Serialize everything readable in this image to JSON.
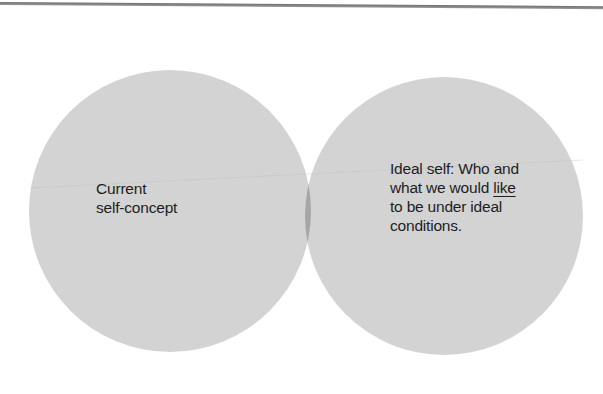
{
  "diagram": {
    "type": "venn",
    "colors": {
      "circle_fill": "#d3d3d3",
      "overlap_fill": "#a6a6a6",
      "text": "#1e1e1e",
      "rule": "#7a7a7a",
      "background": "#ffffff"
    },
    "sets": [
      {
        "id": "current-self-concept",
        "lines": [
          "Current",
          "self-concept"
        ]
      },
      {
        "id": "ideal-self",
        "lines": [
          "Ideal self: Who and",
          "what we would ",
          "like",
          "to be under ideal",
          "conditions."
        ]
      }
    ],
    "overlap": {
      "label": ""
    }
  }
}
